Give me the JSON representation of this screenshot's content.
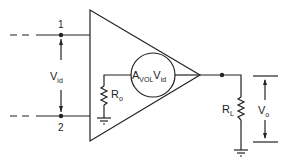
{
  "diagram": {
    "nodes": {
      "input1": {
        "label": "1"
      },
      "input2": {
        "label": "2"
      }
    },
    "labels": {
      "vid_main": "V",
      "vid_sub": "id",
      "source_A": "A",
      "source_sub": "VOL",
      "source_V": "V",
      "source_vsub": "id",
      "ro_main": "R",
      "ro_sub": "o",
      "rl_main": "R",
      "rl_sub": "L",
      "vo_main": "V",
      "vo_sub": "o"
    },
    "components": [
      {
        "type": "amplifier-triangle"
      },
      {
        "type": "dependent-voltage-source",
        "expr": "AVOL·Vid"
      },
      {
        "type": "resistor",
        "name": "Ro"
      },
      {
        "type": "resistor",
        "name": "RL"
      },
      {
        "type": "ground",
        "count": 2
      }
    ],
    "colors": {
      "line": "#222222",
      "background": "#ffffff"
    }
  }
}
